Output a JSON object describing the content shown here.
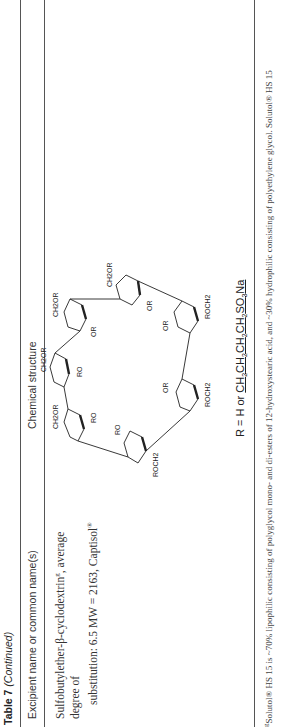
{
  "table": {
    "number_label": "Table 7",
    "continued_label": "(Continued)",
    "columns": [
      "Excipient name or common name(s)",
      "Chemical structure"
    ],
    "rows": [
      {
        "name_line1": "Sulfobutylether-β-cyclodextrin",
        "name_sup": "g",
        "name_line1_end": ", average degree of",
        "name_line2": "substitution: 6.5 MW = 2163, Captisol",
        "name_reg": "®",
        "structure_label": "Sulfobutylether-β-cyclodextrin ring of seven glucose units",
        "r_definition_prefix": "R = H or",
        "r_definition_formula": "CH2CH2CH2CH2SO3Na"
      }
    ]
  },
  "structure_labels": {
    "ch2or": "CH2OR",
    "roch2": "ROCH2",
    "ro": "RO",
    "or": "OR",
    "o": "O"
  },
  "footnote": {
    "marker": "g",
    "text": "Solutol® HS 15 is ~70% lipophilic consisting of polyglycol mono- and di-esters of 12-hydroxystearic acid, and ~30% hydrophilic consisting of polyethylene glycol. Solutol® HS 15"
  }
}
